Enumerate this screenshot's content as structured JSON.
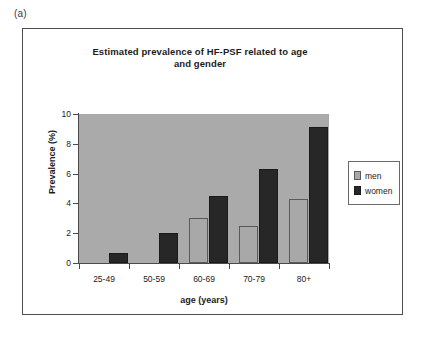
{
  "panel": {
    "label": "(a)"
  },
  "chart_data": {
    "type": "bar",
    "title": "Estimated prevalence of HF-PSF related to age and gender",
    "title_line1": "Estimated prevalence of HF-PSF related to age",
    "title_line2": "and gender",
    "xlabel": "age (years)",
    "ylabel": "Prevalence (%)",
    "categories": [
      "25-49",
      "50-59",
      "60-69",
      "70-79",
      "80+"
    ],
    "series": [
      {
        "name": "men",
        "color": "#a8a8a8",
        "values": [
          0,
          0,
          3.0,
          2.5,
          4.3
        ]
      },
      {
        "name": "women",
        "color": "#272727",
        "values": [
          0.7,
          2.0,
          4.5,
          6.3,
          9.1
        ]
      }
    ],
    "ylim": [
      0,
      10
    ],
    "yticks": [
      0,
      2,
      4,
      6,
      8,
      10
    ],
    "ytick_labels": [
      "0",
      "2",
      "4",
      "6",
      "8",
      "10"
    ],
    "grid": false,
    "legend_position": "right",
    "plot_background": "#aaaaaa"
  }
}
